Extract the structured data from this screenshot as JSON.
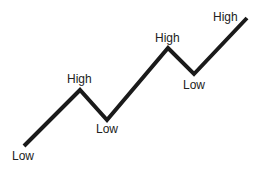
{
  "diagram": {
    "type": "zigzag-trend",
    "line_color": "#1a1a1a",
    "points": [
      {
        "x": 24,
        "y": 146,
        "label": "Low"
      },
      {
        "x": 80,
        "y": 90,
        "label": "High"
      },
      {
        "x": 107,
        "y": 120,
        "label": "Low"
      },
      {
        "x": 168,
        "y": 48,
        "label": "High"
      },
      {
        "x": 194,
        "y": 74,
        "label": "Low"
      },
      {
        "x": 247,
        "y": 18,
        "label": "High"
      }
    ],
    "labels": [
      "Low",
      "High",
      "Low",
      "High",
      "Low",
      "High"
    ]
  }
}
